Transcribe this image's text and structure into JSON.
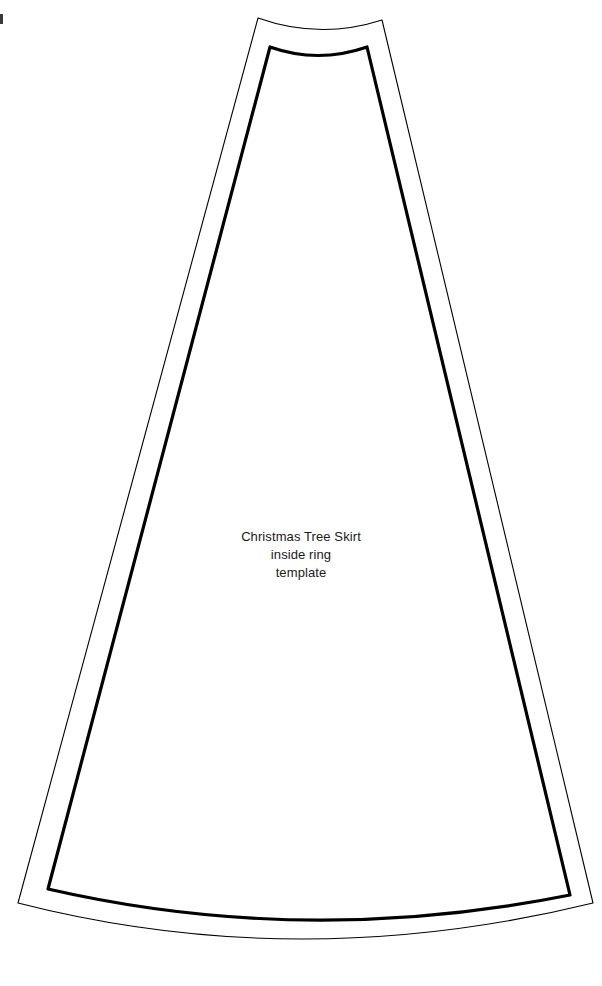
{
  "page": {
    "title": "Christmas Tree Skirt inside ring template",
    "background_color": "#ffffff",
    "width": 602,
    "height": 986
  },
  "label": {
    "line1": "Christmas Tree Skirt",
    "line2": "inside ring",
    "line3": "template",
    "color": "#1a1a1a",
    "align": "center"
  },
  "shapes": {
    "outer": {
      "name": "outer-cutting-line",
      "stroke_color": "#000000",
      "stroke_width": 1,
      "fill": "none",
      "description": "thin outer wedge outline",
      "path": "M 258 18 L 18 903 Q 300 975 593 903 L 382 20 Q 320 40 258 18 Z"
    },
    "inner": {
      "name": "inner-sewing-line",
      "stroke_color": "#000000",
      "stroke_width": 3,
      "fill": "none",
      "description": "thick inner wedge outline",
      "path": "M 270 47 L 48 889 Q 305 948 570 895 L 367 47 Q 318 64 270 47 Z"
    }
  },
  "artifact": {
    "name": "scan-edge-mark",
    "color": "#3a3a3a"
  }
}
